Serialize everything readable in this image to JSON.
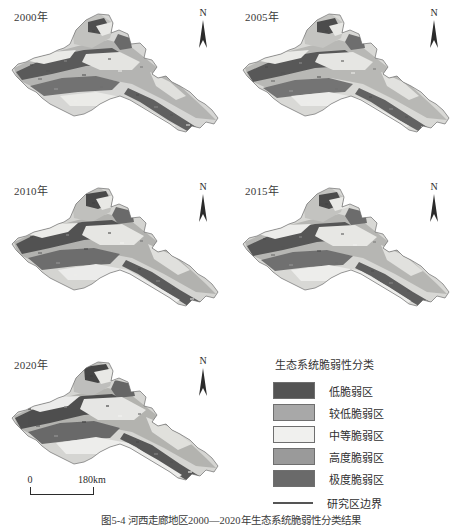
{
  "figure": {
    "caption": "图5-4  河西走廊地区2000—2020年生态系统脆弱性分类结果"
  },
  "panels": [
    {
      "year_label": "2000年",
      "north_label": "N"
    },
    {
      "year_label": "2005年",
      "north_label": "N"
    },
    {
      "year_label": "2010年",
      "north_label": "N"
    },
    {
      "year_label": "2015年",
      "north_label": "N"
    },
    {
      "year_label": "2020年",
      "north_label": "N"
    }
  ],
  "scalebar": {
    "min_label": "0",
    "max_label": "180km"
  },
  "legend": {
    "title": "生态系统脆弱性分类",
    "items": [
      {
        "label": "低脆弱区",
        "color": "#545454"
      },
      {
        "label": "较低脆弱区",
        "color": "#a8a8a8"
      },
      {
        "label": "中等脆弱区",
        "color": "#f0f0ee"
      },
      {
        "label": "高度脆弱区",
        "color": "#9a9a9a"
      },
      {
        "label": "极度脆弱区",
        "color": "#6a6a6a"
      }
    ],
    "boundary": {
      "label": "研究区边界",
      "color": "#555555"
    }
  }
}
